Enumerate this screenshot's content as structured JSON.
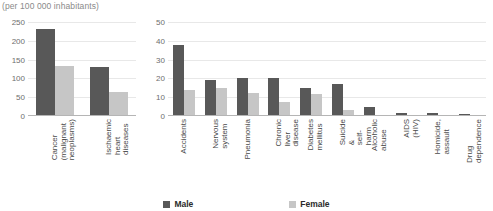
{
  "unit_note": "(per 100 000 inhabitants)",
  "legend": {
    "items": [
      {
        "label": "Male",
        "color": "#585858",
        "swatch_name": "male-swatch"
      },
      {
        "label": "Female",
        "color": "#c6c6c6",
        "swatch_name": "female-swatch"
      }
    ]
  },
  "chart_data": [
    {
      "type": "bar",
      "id": "leading-causes-high-rate",
      "title": "",
      "subtitle": "(per 100 000 inhabitants)",
      "xlabel": "",
      "ylabel": "",
      "ylim": [
        0,
        250
      ],
      "yticks": [
        0,
        50,
        100,
        150,
        200,
        250
      ],
      "grid": true,
      "legend_position": "bottom-center",
      "categories": [
        "Cancer\n(malignant\nneoplasms)",
        "Ischaemic\nheart\ndiseases"
      ],
      "series": [
        {
          "name": "Male",
          "color": "#585858",
          "values": [
            232,
            130
          ]
        },
        {
          "name": "Female",
          "color": "#c6c6c6",
          "values": [
            133,
            65
          ]
        }
      ]
    },
    {
      "type": "bar",
      "id": "leading-causes-lower-rate",
      "title": "",
      "subtitle": "",
      "xlabel": "",
      "ylabel": "",
      "ylim": [
        0,
        50
      ],
      "yticks": [
        0,
        10,
        20,
        30,
        40,
        50
      ],
      "grid": true,
      "legend_position": "bottom-center",
      "categories": [
        "Accidents",
        "Nervous\nsystem",
        "Pneumonia",
        "Chronic liver\ndisease",
        "Diabetes\nmellitus",
        "Suicide &\nself-harm",
        "Alcoholic\nabuse",
        "AIDS (HIV)",
        "Homicide,\nassault",
        "Drug\ndependence"
      ],
      "series": [
        {
          "name": "Male",
          "color": "#585858",
          "values": [
            38,
            19,
            20,
            20,
            15,
            17,
            5,
            1.5,
            1.8,
            1.2
          ]
        },
        {
          "name": "Female",
          "color": "#c6c6c6",
          "values": [
            14,
            15,
            12.5,
            7.5,
            11.5,
            3,
            0.7,
            0.4,
            0.4,
            0.3
          ]
        }
      ]
    }
  ]
}
